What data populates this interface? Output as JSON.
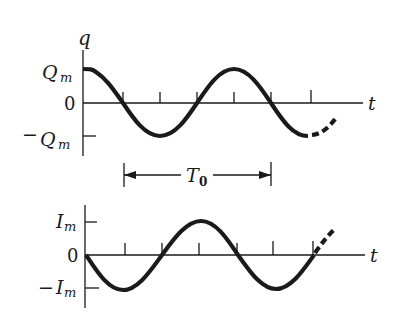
{
  "charge_plot": {
    "y_axis_label": "q",
    "x_axis_label": "t",
    "ticks": {
      "top": "Q",
      "top_sub": "m",
      "zero": "0",
      "bottom_prefix": "−",
      "bottom": "Q",
      "bottom_sub": "m"
    },
    "curve": "cosine",
    "continuation": "dashed"
  },
  "period_marker": {
    "label": "T",
    "label_sub": "0"
  },
  "current_plot": {
    "x_axis_label": "t",
    "ticks": {
      "top": "I",
      "top_sub": "m",
      "zero": "0",
      "bottom_prefix": "−",
      "bottom": "I",
      "bottom_sub": "m"
    },
    "curve": "negative sine",
    "continuation": "dashed"
  },
  "colors": {
    "ink": "#1a1a1a",
    "background": "#ffffff"
  }
}
